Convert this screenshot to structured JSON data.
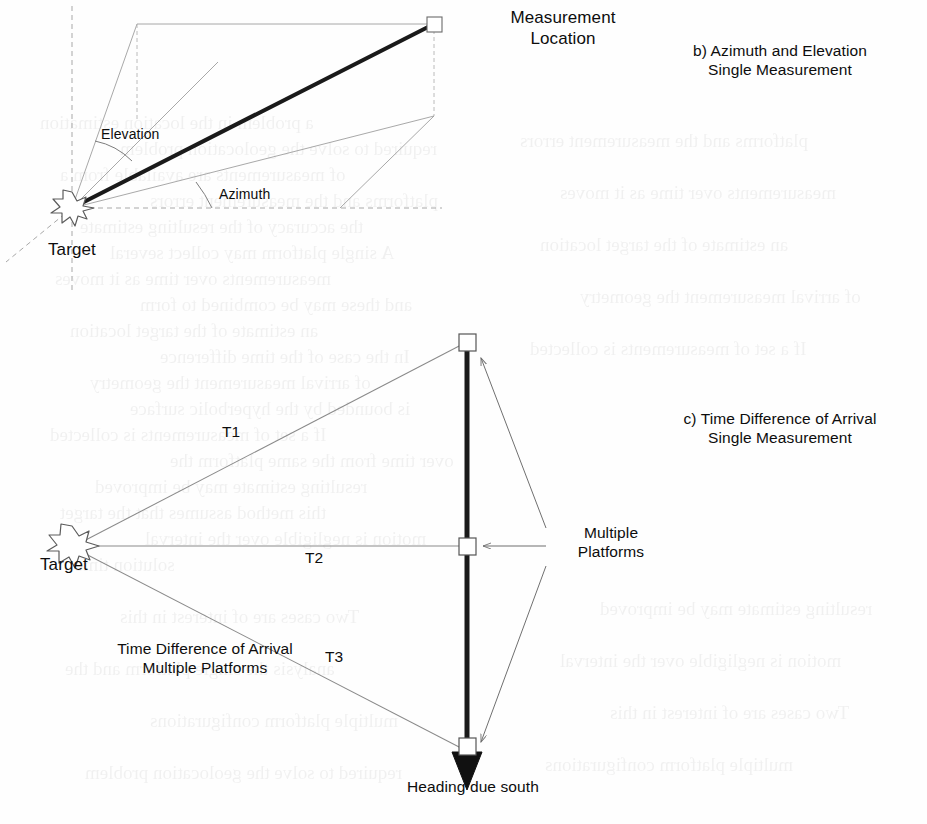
{
  "figure": {
    "captions": {
      "b": {
        "line1": "b) Azimuth and Elevation",
        "line2": "Single Measurement"
      },
      "c": {
        "line1": "c) Time Difference of Arrival",
        "line2": "Single Measurement"
      }
    },
    "panel_b": {
      "measurement_location": {
        "line1": "Measurement",
        "line2": "Location"
      },
      "target_label": "Target",
      "elevation_label": "Elevation",
      "azimuth_label": "Azimuth"
    },
    "panel_c": {
      "target_label": "Target",
      "time_labels": [
        "T1",
        "T2",
        "T3"
      ],
      "t1": "T1",
      "t2": "T2",
      "t3": "T3",
      "tdoa_caption": {
        "line1": "Time Difference of Arrival",
        "line2": "Multiple Platforms"
      },
      "multiple_platforms": {
        "line1": "Multiple",
        "line2": "Platforms"
      },
      "heading_label": "Heading due south"
    },
    "colors": {
      "ink": "#0d0d0d",
      "heavy_line": "#1a1a1a",
      "construction_line": "#8c8c8c",
      "dashed_line": "#9a9a9a",
      "marker_fill": "#ffffff",
      "paper": "#fefefe"
    },
    "ghost_text": [
      "a problem in the location estimation",
      "required to solve the geolocation problem",
      "of measurements are available from a",
      "platforms and the measurement errors",
      "the accuracy of the resulting estimate",
      "A single platform may collect several",
      "measurements over time as it moves",
      "and these may be combined to form",
      "an estimate of the target location",
      "In the case of the time difference",
      "of arrival measurement the geometry",
      "is bounded by the hyperbolic surface",
      "If a set of measurements is collected",
      "over time from the same platform the",
      "resulting estimate may be improved",
      "this method assumes that the target",
      "motion is negligible over the interval",
      "solution time",
      "Two cases are of interest in this",
      "analysis the single platform and the",
      "multiple platform configurations"
    ]
  }
}
